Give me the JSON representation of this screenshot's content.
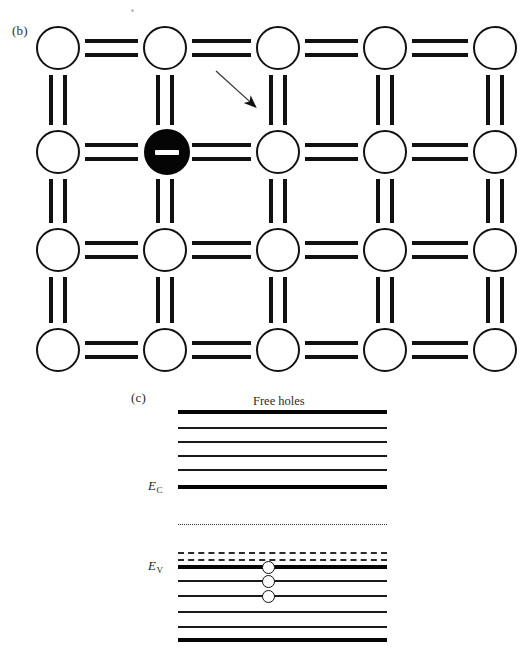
{
  "figure": {
    "panel_b_label": "(b)",
    "panel_c_label": "(c)",
    "free_holes_label": "Free holes",
    "conduction_band_label": "E",
    "conduction_band_sub": "C",
    "valence_band_label": "E",
    "valence_band_sub": "V",
    "ion_charge_symbol": "–"
  },
  "colors": {
    "ink": "#111111",
    "ion_fill": "#050505",
    "paper": "#ffffff",
    "dotted_line": "#2f2f2f",
    "dashed_line": "#2a2a2a"
  },
  "lattice": {
    "type": "covalent-bond-2d-grid",
    "rows": 4,
    "columns": 5,
    "atom_radius_px": 22,
    "row_centers_y": [
      48,
      152,
      250,
      350
    ],
    "column_centers_x": [
      58,
      165,
      278,
      385,
      495
    ],
    "bond_style": "double-bar",
    "acceptor_ion": {
      "row": 2,
      "column": 2,
      "center_x": 167,
      "center_y": 152,
      "radius_px": 23,
      "charge": "negative",
      "symbol": "–"
    },
    "annotation_arrow": {
      "label": "points-to-free-hole-region",
      "x1": 216,
      "y1": 71,
      "x2": 259,
      "y2": 110
    },
    "atoms": [
      {
        "id": "a-r1c1",
        "x": 58,
        "y": 48,
        "kind": "neutral"
      },
      {
        "id": "a-r1c2",
        "x": 165,
        "y": 48,
        "kind": "neutral"
      },
      {
        "id": "a-r1c3",
        "x": 278,
        "y": 48,
        "kind": "neutral"
      },
      {
        "id": "a-r1c4",
        "x": 385,
        "y": 48,
        "kind": "neutral"
      },
      {
        "id": "a-r1c5",
        "x": 495,
        "y": 48,
        "kind": "neutral"
      },
      {
        "id": "a-r2c1",
        "x": 58,
        "y": 152,
        "kind": "neutral"
      },
      {
        "id": "a-r2c2",
        "x": 167,
        "y": 152,
        "kind": "acceptor-ion"
      },
      {
        "id": "a-r2c3",
        "x": 278,
        "y": 152,
        "kind": "neutral"
      },
      {
        "id": "a-r2c4",
        "x": 385,
        "y": 152,
        "kind": "neutral"
      },
      {
        "id": "a-r2c5",
        "x": 495,
        "y": 152,
        "kind": "neutral"
      },
      {
        "id": "a-r3c1",
        "x": 58,
        "y": 250,
        "kind": "neutral"
      },
      {
        "id": "a-r3c2",
        "x": 165,
        "y": 250,
        "kind": "neutral"
      },
      {
        "id": "a-r3c3",
        "x": 278,
        "y": 250,
        "kind": "neutral"
      },
      {
        "id": "a-r3c4",
        "x": 385,
        "y": 250,
        "kind": "neutral"
      },
      {
        "id": "a-r3c5",
        "x": 495,
        "y": 250,
        "kind": "neutral"
      },
      {
        "id": "a-r4c1",
        "x": 58,
        "y": 350,
        "kind": "neutral"
      },
      {
        "id": "a-r4c2",
        "x": 165,
        "y": 350,
        "kind": "neutral"
      },
      {
        "id": "a-r4c3",
        "x": 278,
        "y": 350,
        "kind": "neutral"
      },
      {
        "id": "a-r4c4",
        "x": 385,
        "y": 350,
        "kind": "neutral"
      },
      {
        "id": "a-r4c5",
        "x": 495,
        "y": 350,
        "kind": "neutral"
      }
    ]
  },
  "band_diagram": {
    "left_x": 178,
    "right_x": 387,
    "levels": [
      {
        "id": "cb-top",
        "y": 412,
        "style": "thick",
        "weight": 4.0,
        "band": "conduction"
      },
      {
        "id": "cb-l2",
        "y": 428,
        "style": "solid",
        "weight": 1.4,
        "band": "conduction"
      },
      {
        "id": "cb-l3",
        "y": 442,
        "style": "solid",
        "weight": 1.4,
        "band": "conduction"
      },
      {
        "id": "cb-l4",
        "y": 456,
        "style": "solid",
        "weight": 1.4,
        "band": "conduction"
      },
      {
        "id": "cb-l5",
        "y": 470,
        "style": "solid",
        "weight": 1.4,
        "band": "conduction"
      },
      {
        "id": "ec",
        "y": 487,
        "style": "thick",
        "weight": 3.6,
        "band": "conduction-edge"
      },
      {
        "id": "fermi",
        "y": 524,
        "style": "dotted",
        "weight": 1.0,
        "band": "gap"
      },
      {
        "id": "acceptor1",
        "y": 552,
        "style": "dashed",
        "weight": 2.0,
        "band": "acceptor"
      },
      {
        "id": "acceptor2",
        "y": 559,
        "style": "dashed",
        "weight": 2.0,
        "band": "acceptor"
      },
      {
        "id": "ev",
        "y": 567,
        "style": "thick",
        "weight": 3.6,
        "band": "valence-edge"
      },
      {
        "id": "vb-l2",
        "y": 581,
        "style": "solid",
        "weight": 1.4,
        "band": "valence"
      },
      {
        "id": "vb-l3",
        "y": 596,
        "style": "solid",
        "weight": 1.4,
        "band": "valence"
      },
      {
        "id": "vb-l4",
        "y": 612,
        "style": "solid",
        "weight": 1.4,
        "band": "valence"
      },
      {
        "id": "vb-l5",
        "y": 627,
        "style": "solid",
        "weight": 1.4,
        "band": "valence"
      },
      {
        "id": "vb-bottom",
        "y": 640,
        "style": "thick",
        "weight": 4.0,
        "band": "valence"
      }
    ],
    "holes": [
      {
        "id": "hole-1",
        "x": 268,
        "y": 567
      },
      {
        "id": "hole-2",
        "x": 268,
        "y": 581
      },
      {
        "id": "hole-3",
        "x": 268,
        "y": 596
      }
    ],
    "hole_count": 3,
    "free_holes_label_x": 253,
    "free_holes_label_y": 394
  }
}
